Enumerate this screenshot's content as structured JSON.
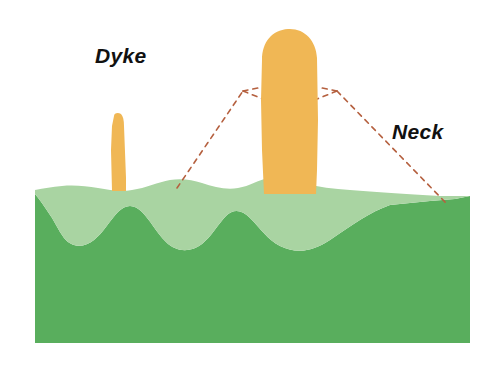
{
  "diagram": {
    "type": "geological-cross-section",
    "canvas": {
      "width": 488,
      "height": 371,
      "background": "#ffffff"
    },
    "labels": [
      {
        "id": "dyke",
        "text": "Dyke",
        "x": 95,
        "y": 44,
        "style": "bold-italic",
        "color": "#111111"
      },
      {
        "id": "neck",
        "text": "Neck",
        "x": 392,
        "y": 120,
        "style": "bold-italic",
        "color": "#111111"
      }
    ],
    "colors": {
      "magma": "#F0B755",
      "magma_edge": "#EEB04A",
      "ground_light": "#A9D4A2",
      "ground_dark": "#59AE5D",
      "eroded_cone_outline": "#B5603F",
      "label_text": "#111111",
      "background": "#ffffff"
    },
    "ground": {
      "left": 35,
      "right": 470,
      "top_surface_y": 187,
      "bottom_y": 343,
      "layer_boundary_y": 232,
      "description": "Two-tone green bedrock block with undulating upper surface and wavy internal layer boundary"
    },
    "intrusions": [
      {
        "id": "dyke-column",
        "name": "Dyke",
        "shape": "narrow-tapering-column",
        "x_center": 118,
        "top_y": 113,
        "base_y": 190,
        "width_top": 9,
        "width_base": 13,
        "fill": "#F0B755"
      },
      {
        "id": "neck-column",
        "name": "Neck",
        "shape": "wide-rounded-top-column",
        "x_center": 289,
        "top_y": 28,
        "base_y": 194,
        "width": 56,
        "fill": "#F0B755"
      }
    ],
    "eroded_cone": {
      "id": "eroded-volcano-outline",
      "description": "Dashed outline of the former volcanic cone removed by erosion",
      "stroke": "#B5603F",
      "dash": "5 5",
      "stroke_width": 1.6,
      "left_base": {
        "x": 177,
        "y": 188
      },
      "left_rim": {
        "x": 243,
        "y": 91
      },
      "left_crater_inner": {
        "x": 262,
        "y": 99
      },
      "right_crater_inner": {
        "x": 318,
        "y": 99
      },
      "right_rim": {
        "x": 337,
        "y": 91
      },
      "right_base": {
        "x": 446,
        "y": 203
      }
    }
  }
}
